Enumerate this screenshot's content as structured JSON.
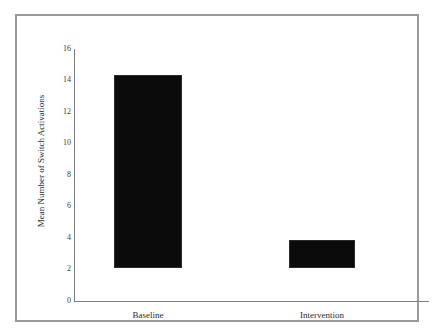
{
  "chart_data": {
    "type": "bar",
    "title": "",
    "xlabel": "",
    "ylabel": "Mean Number of Switch Activations",
    "categories": [
      "Baseline",
      "Intervention"
    ],
    "values": [
      14,
      2
    ],
    "ylim": [
      0,
      16
    ],
    "yticks": [
      0,
      2,
      4,
      6,
      8,
      10,
      12,
      14,
      16
    ],
    "ytick_labels": [
      "0",
      "2",
      "4",
      "6",
      "8",
      "10",
      "12",
      "14",
      "16"
    ],
    "grid": false,
    "legend": null,
    "bar_color": "#0b0b0b",
    "axis_color": "#808080",
    "frame_color": "#9a9a9a",
    "background": "#ffffff"
  },
  "axis": {
    "y_title": "Mean Number of Switch Activations"
  }
}
